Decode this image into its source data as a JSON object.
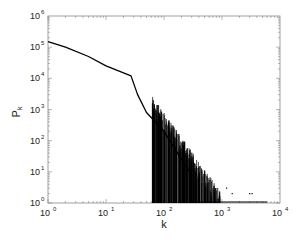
{
  "chart_data": {
    "type": "line",
    "title": "",
    "xlabel": "k",
    "ylabel": "P_k",
    "xscale": "log",
    "yscale": "log",
    "xlim": [
      1,
      10000
    ],
    "ylim": [
      1,
      1000000
    ],
    "grid": false,
    "legend": null,
    "x_ticks": [
      "10^0",
      "10^1",
      "10^2",
      "10^3",
      "10^4"
    ],
    "y_ticks": [
      "10^0",
      "10^1",
      "10^2",
      "10^3",
      "10^4",
      "10^5",
      "10^6"
    ],
    "series": [
      {
        "name": "P_k",
        "x": [
          1,
          2,
          5,
          10,
          20,
          27,
          35,
          50,
          100,
          200,
          300,
          500,
          1000,
          3000,
          5000
        ],
        "y": [
          150000,
          100000,
          50000,
          25000,
          15000,
          12000,
          3000,
          800,
          200,
          25,
          8,
          2,
          1,
          1,
          1
        ]
      }
    ]
  }
}
